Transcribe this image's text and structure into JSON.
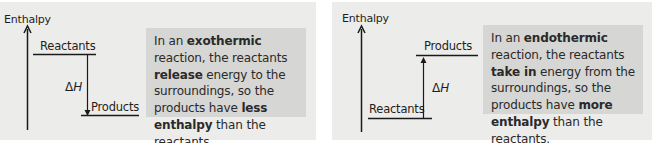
{
  "colors": {
    "panel_bg": "#ececea",
    "textbox_bg": "#d6d6d4",
    "line": "#1a1a1a",
    "text": "#2a2a2a"
  },
  "exothermic": {
    "axis_label": "Enthalpy",
    "upper_level_label": "Reactants",
    "lower_level_label": "Products",
    "delta_symbol": "Δ",
    "delta_var": "H",
    "arrow_direction": "down",
    "text": {
      "p1": "In an ",
      "b1": "exothermic",
      "p2": " reaction, the reactants ",
      "b2": "release",
      "p3": " energy to the surroundings, so the products have ",
      "b3": "less enthalpy",
      "p4": " than the reactants."
    }
  },
  "endothermic": {
    "axis_label": "Enthalpy",
    "upper_level_label": "Products",
    "lower_level_label": "Reactants",
    "delta_symbol": "Δ",
    "delta_var": "H",
    "arrow_direction": "up",
    "text": {
      "p1": "In an ",
      "b1": "endothermic",
      "p2": " reaction, the reactants ",
      "b2": "take in",
      "p3": " energy from the surroundings, so the products have ",
      "b3": "more enthalpy",
      "p4": " than the reactants."
    }
  }
}
